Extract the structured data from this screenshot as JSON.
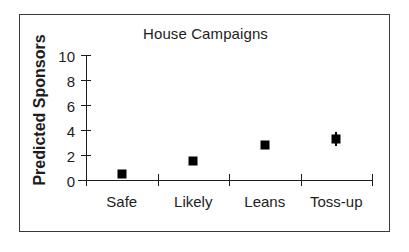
{
  "chart_data": {
    "type": "scatter",
    "title": "House Campaigns",
    "xlabel": "",
    "ylabel": "Predicted Sponsors",
    "categories": [
      "Safe",
      "Likely",
      "Leans",
      "Toss-up"
    ],
    "values": [
      0.45,
      1.55,
      2.8,
      3.3
    ],
    "errors_low": [
      0.15,
      0.15,
      0.35,
      0.55
    ],
    "errors_high": [
      0.15,
      0.15,
      0.2,
      0.55
    ],
    "ylim": [
      0,
      10
    ],
    "yticks": [
      0,
      2,
      4,
      6,
      8,
      10
    ],
    "yticklabels": [
      "0",
      "2",
      "4",
      "6",
      "8",
      "10"
    ],
    "grid": false,
    "legend": null,
    "marker": "filled-square",
    "marker_color": "#000000",
    "axis_color": "#1d1d1d"
  },
  "figure": {
    "border_color": "#3a3a3a",
    "background": "#ffffff"
  }
}
